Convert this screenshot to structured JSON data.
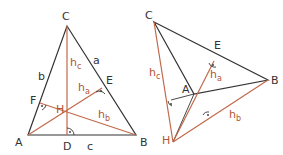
{
  "colors": {
    "side": "#333333",
    "altitude": "#c0694a",
    "label_red": "#b5542f"
  },
  "left": {
    "vertices": {
      "A": "A",
      "B": "B",
      "C": "C"
    },
    "feet": {
      "D": "D",
      "E": "E",
      "F": "F"
    },
    "orthocenter": "H",
    "sides": {
      "a": "a",
      "b": "b",
      "c": "c"
    },
    "altitudes": {
      "ha": "h",
      "hb": "h",
      "hc": "h",
      "sub_a": "a",
      "sub_b": "b",
      "sub_c": "c"
    }
  },
  "right": {
    "vertices": {
      "A": "A",
      "B": "B",
      "C": "C"
    },
    "feet": {
      "E": "E"
    },
    "orthocenter": "H",
    "altitudes": {
      "ha": "h",
      "hb": "h",
      "hc": "h",
      "sub_a": "a",
      "sub_b": "b",
      "sub_c": "c"
    }
  }
}
